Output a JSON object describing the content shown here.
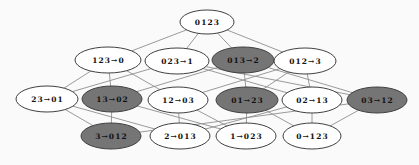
{
  "diagram": {
    "colors": {
      "background": "#fafafa",
      "node_fill": "#ffffff",
      "node_fill_highlight": "#757575",
      "node_stroke": "#404040",
      "edge": "#8f8f8f",
      "text": "#111111"
    },
    "nodes": [
      {
        "id": "0123",
        "label": "0123",
        "x": 207,
        "y": 22,
        "rx": 27,
        "ry": 12,
        "highlighted": false
      },
      {
        "id": "123-0",
        "label": "123→0",
        "x": 108,
        "y": 60,
        "rx": 33,
        "ry": 13,
        "highlighted": false
      },
      {
        "id": "023-1",
        "label": "023→1",
        "x": 177,
        "y": 61,
        "rx": 32,
        "ry": 13,
        "highlighted": false
      },
      {
        "id": "013-2",
        "label": "013→2",
        "x": 243,
        "y": 60,
        "rx": 31,
        "ry": 13,
        "highlighted": true
      },
      {
        "id": "012-3",
        "label": "012→3",
        "x": 305,
        "y": 61,
        "rx": 31,
        "ry": 13,
        "highlighted": false
      },
      {
        "id": "23-01",
        "label": "23→01",
        "x": 47,
        "y": 99,
        "rx": 31,
        "ry": 13,
        "highlighted": false
      },
      {
        "id": "13-02",
        "label": "13→02",
        "x": 112,
        "y": 99,
        "rx": 30,
        "ry": 13,
        "highlighted": true
      },
      {
        "id": "12-03",
        "label": "12→03",
        "x": 178,
        "y": 100,
        "rx": 30,
        "ry": 13,
        "highlighted": false
      },
      {
        "id": "01-23",
        "label": "01→23",
        "x": 247,
        "y": 100,
        "rx": 31,
        "ry": 13,
        "highlighted": true
      },
      {
        "id": "02-13",
        "label": "02→13",
        "x": 312,
        "y": 100,
        "rx": 30,
        "ry": 13,
        "highlighted": false
      },
      {
        "id": "03-12",
        "label": "03→12",
        "x": 377,
        "y": 100,
        "rx": 30,
        "ry": 13,
        "highlighted": true
      },
      {
        "id": "3-012",
        "label": "3→012",
        "x": 111,
        "y": 136,
        "rx": 30,
        "ry": 13,
        "highlighted": true
      },
      {
        "id": "2-013",
        "label": "2→013",
        "x": 180,
        "y": 136,
        "rx": 30,
        "ry": 13,
        "highlighted": false
      },
      {
        "id": "1-023",
        "label": "1→023",
        "x": 246,
        "y": 136,
        "rx": 30,
        "ry": 13,
        "highlighted": false
      },
      {
        "id": "0-123",
        "label": "0→123",
        "x": 312,
        "y": 136,
        "rx": 29,
        "ry": 13,
        "highlighted": false
      }
    ],
    "edges": [
      {
        "from": "0123",
        "to": "123-0"
      },
      {
        "from": "0123",
        "to": "023-1"
      },
      {
        "from": "0123",
        "to": "013-2"
      },
      {
        "from": "0123",
        "to": "012-3"
      },
      {
        "from": "123-0",
        "to": "23-01"
      },
      {
        "from": "123-0",
        "to": "13-02"
      },
      {
        "from": "123-0",
        "to": "12-03"
      },
      {
        "from": "023-1",
        "to": "23-01"
      },
      {
        "from": "023-1",
        "to": "03-12"
      },
      {
        "from": "023-1",
        "to": "02-13"
      },
      {
        "from": "013-2",
        "to": "13-02"
      },
      {
        "from": "013-2",
        "to": "03-12"
      },
      {
        "from": "013-2",
        "to": "01-23"
      },
      {
        "from": "012-3",
        "to": "12-03"
      },
      {
        "from": "012-3",
        "to": "02-13"
      },
      {
        "from": "012-3",
        "to": "01-23"
      },
      {
        "from": "23-01",
        "to": "3-012"
      },
      {
        "from": "23-01",
        "to": "2-013"
      },
      {
        "from": "13-02",
        "to": "3-012"
      },
      {
        "from": "13-02",
        "to": "1-023"
      },
      {
        "from": "12-03",
        "to": "2-013"
      },
      {
        "from": "12-03",
        "to": "1-023"
      },
      {
        "from": "01-23",
        "to": "1-023"
      },
      {
        "from": "01-23",
        "to": "0-123"
      },
      {
        "from": "02-13",
        "to": "2-013"
      },
      {
        "from": "02-13",
        "to": "0-123"
      },
      {
        "from": "03-12",
        "to": "3-012"
      },
      {
        "from": "03-12",
        "to": "0-123"
      }
    ]
  }
}
